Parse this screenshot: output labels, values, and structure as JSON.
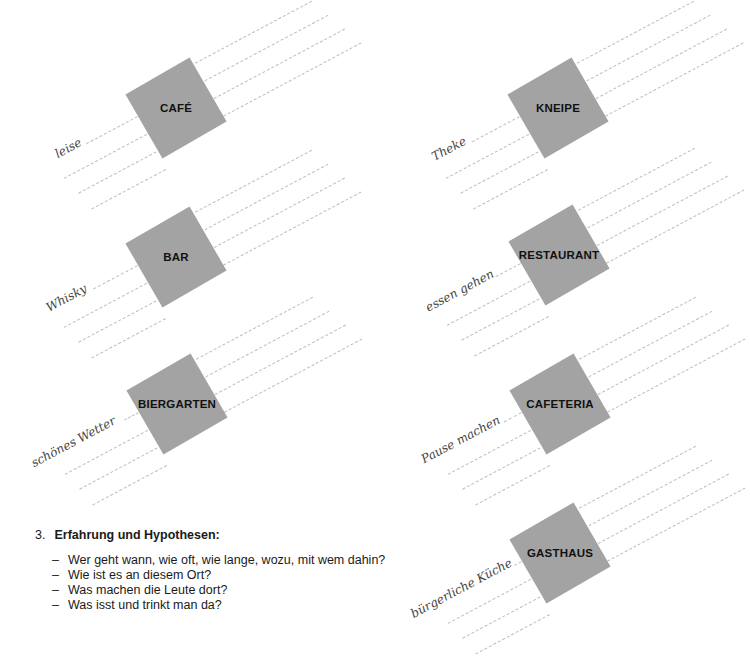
{
  "blocks": [
    {
      "label": "CAFÉ",
      "word": "leise"
    },
    {
      "label": "KNEIPE",
      "word": "Theke"
    },
    {
      "label": "BAR",
      "word": "Whisky"
    },
    {
      "label": "RESTAURANT",
      "word": "essen gehen"
    },
    {
      "label": "BIERGARTEN",
      "word": "schönes Wetter"
    },
    {
      "label": "CAFETERIA",
      "word": "Pause machen"
    },
    {
      "label": "GASTHAUS",
      "word": "bürgerliche Küche"
    }
  ],
  "task": {
    "number": "3.",
    "title": "Erfahrung und Hypothesen:",
    "items": [
      "Wer geht wann, wie oft, wie lange, wozu, mit wem dahin?",
      "Wie ist es an diesem Ort?",
      "Was machen die Leute dort?",
      "Was isst und trinkt man da?"
    ]
  },
  "colors": {
    "square": "#a3a3a3",
    "dashed_line": "#bdbdbd"
  }
}
